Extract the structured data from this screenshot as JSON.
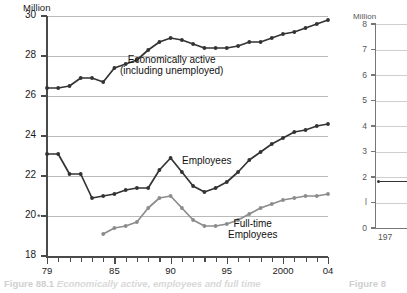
{
  "figure": {
    "caption_number": "Figure 88.1",
    "caption_text": "Economically active, employees and full time",
    "side_caption_number": "Figure 8",
    "side_caption_text": ""
  },
  "main_chart": {
    "unit_label": "Million",
    "series_labels": {
      "economically_active": "Economically active\n(including unemployed)",
      "economically_active_line1": "Economically active",
      "economically_active_line2": "(including unemployed)",
      "employees": "Employees",
      "fulltime_line1": "Full-time",
      "fulltime_line2": "Employees"
    },
    "footnote_marker": "*"
  },
  "side_chart": {
    "unit_label": "Million",
    "x_label": "197",
    "y_ticks": [
      "8",
      "7",
      "6",
      "5",
      "4",
      "3",
      "2",
      "l",
      "0"
    ]
  },
  "colors": {
    "series_dark": "#333333",
    "series_grey": "#8c8c8c",
    "gridline": "#b9b9b9",
    "axis": "#4a4a4a",
    "caption_grey": "#d2d2d2"
  },
  "chart_data": {
    "type": "line",
    "title": "Economically active, employees and full time",
    "xlabel": "",
    "ylabel": "Million",
    "ylim": [
      18,
      30
    ],
    "yticks": [
      18,
      20,
      22,
      24,
      26,
      28,
      30
    ],
    "xlim": [
      1979,
      2004
    ],
    "xticks": [
      1979,
      1980,
      1981,
      1982,
      1983,
      1984,
      1985,
      1986,
      1987,
      1988,
      1989,
      1990,
      1991,
      1992,
      1993,
      1994,
      1995,
      1996,
      1997,
      1998,
      1999,
      2000,
      2001,
      2002,
      2003,
      2004
    ],
    "xtick_labels": {
      "1979": "79",
      "1985": "85",
      "1990": "90",
      "1995": "95",
      "2000": "2000",
      "2004": "04"
    },
    "grid": true,
    "legend": "inline-annotations",
    "x": [
      1979,
      1980,
      1981,
      1982,
      1983,
      1984,
      1985,
      1986,
      1987,
      1988,
      1989,
      1990,
      1991,
      1992,
      1993,
      1994,
      1995,
      1996,
      1997,
      1998,
      1999,
      2000,
      2001,
      2002,
      2003,
      2004
    ],
    "series": [
      {
        "name": "Economically active (including unemployed)",
        "color": "#333333",
        "values": [
          26.4,
          26.4,
          26.5,
          26.9,
          26.9,
          26.7,
          27.4,
          27.6,
          27.8,
          28.3,
          28.7,
          28.9,
          28.8,
          28.6,
          28.4,
          28.4,
          28.4,
          28.5,
          28.7,
          28.7,
          28.9,
          29.1,
          29.2,
          29.4,
          29.6,
          29.8
        ]
      },
      {
        "name": "Employees",
        "color": "#333333",
        "values": [
          23.1,
          23.1,
          22.1,
          22.1,
          20.9,
          21.0,
          21.1,
          21.3,
          21.4,
          21.4,
          22.3,
          22.9,
          22.2,
          21.5,
          21.2,
          21.4,
          21.7,
          22.2,
          22.8,
          23.2,
          23.6,
          23.9,
          24.2,
          24.3,
          24.5,
          24.6
        ]
      },
      {
        "name": "Full-time Employees",
        "color": "#8c8c8c",
        "values": [
          null,
          null,
          null,
          null,
          null,
          19.1,
          19.4,
          19.5,
          19.7,
          20.4,
          20.9,
          21.0,
          20.4,
          19.8,
          19.5,
          19.5,
          19.6,
          19.8,
          20.1,
          20.4,
          20.6,
          20.8,
          20.9,
          21.0,
          21.0,
          21.1
        ]
      }
    ]
  },
  "side_chart_data": {
    "type": "line",
    "ylabel": "Million",
    "ylim": [
      0,
      8
    ],
    "yticks": [
      0,
      1,
      2,
      3,
      4,
      5,
      6,
      7,
      8
    ],
    "xtick_labels": [
      "197"
    ],
    "values_visible": [
      1.8
    ]
  }
}
